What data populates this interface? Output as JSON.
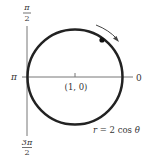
{
  "diagram": {
    "type": "polar-graph",
    "curve": {
      "equation": "r = 2 cos θ",
      "equation_parts": {
        "lhs": "r",
        "eq": "=",
        "rhs_num": "2 cos",
        "theta": "θ"
      },
      "color": "#222222"
    },
    "axes": {
      "top_label": {
        "num": "π",
        "den": "2"
      },
      "bottom_label": {
        "num": "3π",
        "den": "2"
      },
      "left_label": "π",
      "right_label": "0",
      "color": "#666666"
    },
    "center_label": "(1, 0)",
    "direction": "clockwise arrow"
  }
}
